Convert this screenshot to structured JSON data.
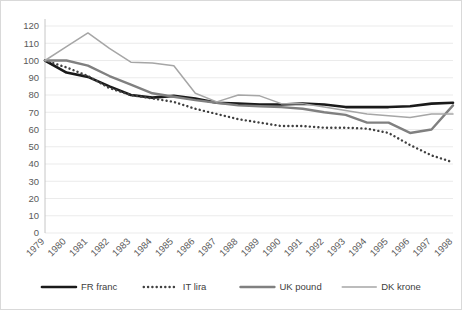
{
  "chart_data": {
    "type": "line",
    "title": "",
    "subtitle": "",
    "xlabel": "",
    "ylabel": "",
    "ylim": [
      0,
      120
    ],
    "ytick_step": 10,
    "yticks": [
      "0",
      "10",
      "20",
      "30",
      "40",
      "50",
      "60",
      "70",
      "80",
      "90",
      "100",
      "110",
      "120"
    ],
    "grid": true,
    "legend_position": "bottom",
    "categories": [
      "1979",
      "1980",
      "1981",
      "1982",
      "1983",
      "1984",
      "1985",
      "1986",
      "1987",
      "1988",
      "1989",
      "1990",
      "1991",
      "1992",
      "1993",
      "1994",
      "1995",
      "1996",
      "1997",
      "1998"
    ],
    "series": [
      {
        "name": "FR franc",
        "color": "#1a1a1a",
        "style": "solid",
        "width": 2.6,
        "values": [
          100,
          93,
          90.5,
          85,
          80,
          78.5,
          79.5,
          78,
          75.5,
          75,
          74.5,
          74.5,
          75,
          74.5,
          73,
          73,
          73,
          73.5,
          75,
          75.5
        ]
      },
      {
        "name": "IT lira",
        "color": "#404040",
        "style": "dotted",
        "width": 2.4,
        "values": [
          100,
          96,
          91,
          84,
          80,
          78,
          76,
          72,
          69,
          66,
          64,
          62,
          62,
          61,
          61,
          60.5,
          58,
          51,
          45,
          41
        ]
      },
      {
        "name": "UK pound",
        "color": "#808080",
        "style": "solid",
        "width": 2.4,
        "values": [
          100,
          100,
          97,
          91,
          86,
          81,
          79,
          77,
          75.5,
          74,
          73.5,
          73,
          72,
          70,
          68.5,
          64,
          64,
          58,
          60,
          74
        ]
      },
      {
        "name": "DK krone",
        "color": "#a6a6a6",
        "style": "solid",
        "width": 1.5,
        "values": [
          100,
          108,
          116,
          107,
          99,
          98.5,
          97,
          81,
          76,
          80,
          79.5,
          75,
          75,
          73,
          71,
          69,
          68,
          67,
          69,
          69
        ]
      }
    ]
  },
  "legend": {
    "items": [
      {
        "label": "FR franc"
      },
      {
        "label": "IT lira"
      },
      {
        "label": "UK pound"
      },
      {
        "label": "DK krone"
      }
    ]
  }
}
